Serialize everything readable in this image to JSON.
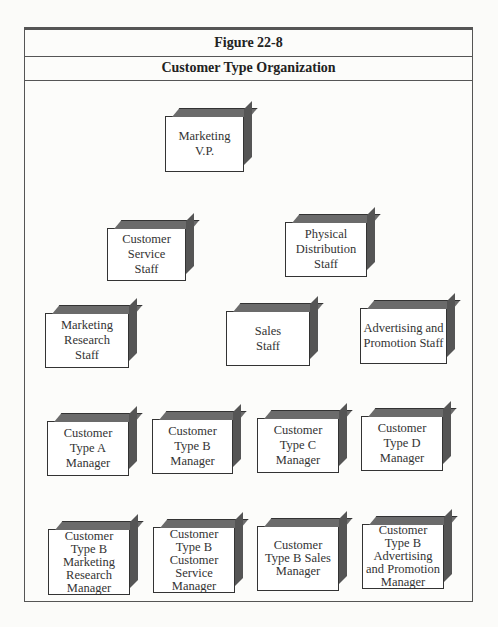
{
  "figure": {
    "number": "Figure 22-8",
    "title": "Customer Type Organization"
  },
  "nodes": {
    "vp": "Marketing V.P.",
    "customer_service_staff": "Customer Service Staff",
    "physical_distribution_staff": "Physical Distribution Staff",
    "marketing_research_staff": "Marketing Research Staff",
    "sales_staff": "Sales Staff",
    "advertising_promotion_staff": "Advertising and Promotion Staff",
    "type_a_manager": "Customer Type A Manager",
    "type_b_manager": "Customer Type B Manager",
    "type_c_manager": "Customer Type C Manager",
    "type_d_manager": "Customer Type D Manager",
    "b_marketing_research_manager": "Customer Type B Marketing Research Manager",
    "b_customer_service_manager": "Customer Type B Customer Service Manager",
    "b_sales_manager": "Customer Type B Sales Manager",
    "b_advertising_promotion_manager": "Customer Type B Advertising and Promotion Manager"
  },
  "colors": {
    "line": "#333333",
    "box_top": "#6b6b6b",
    "box_side": "#555555"
  }
}
